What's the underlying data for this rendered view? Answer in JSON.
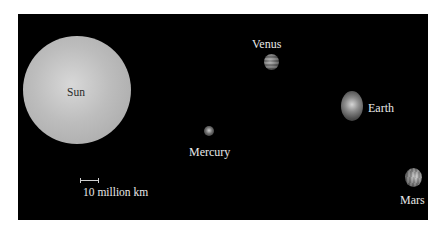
{
  "figure": {
    "background_color": "#000000",
    "frame_color": "#ffffff",
    "bodies": [
      {
        "name": "Sun",
        "label": "Sun",
        "color": "#bdbdbd"
      },
      {
        "name": "Mercury",
        "label": "Mercury",
        "color": "#8a8a8a"
      },
      {
        "name": "Venus",
        "label": "Venus",
        "color": "#8a8a8a"
      },
      {
        "name": "Earth",
        "label": "Earth",
        "color": "#8a8a8a"
      },
      {
        "name": "Mars",
        "label": "Mars",
        "color": "#8a8a8a"
      }
    ],
    "scale_bar": {
      "label": "10 million km"
    }
  }
}
